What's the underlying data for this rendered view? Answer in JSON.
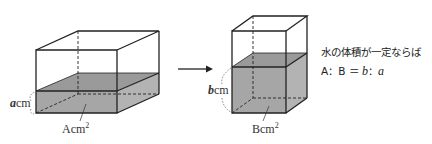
{
  "diagram": {
    "box_before": {
      "height_var": "a",
      "height_unit": "cm",
      "base_label": "A",
      "base_unit": "cm",
      "base_exp": "2"
    },
    "box_after": {
      "height_var": "b",
      "height_unit": "cm",
      "base_label": "B",
      "base_unit": "cm",
      "base_exp": "2"
    },
    "arrow": "right-arrow",
    "note": {
      "line1": "水の体積が一定ならば",
      "line2_prefix": "A：B ＝ ",
      "line2_b": "b",
      "line2_sep": "：",
      "line2_a": "a"
    },
    "colors": {
      "water": "#a6a6a6",
      "line": "#222222"
    }
  }
}
